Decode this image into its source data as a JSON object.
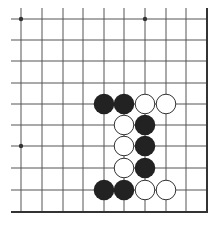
{
  "board": {
    "type": "go-diagram-partial",
    "colors": {
      "background": "#ffffff",
      "line": "#555555",
      "border": "#333333",
      "black_stone": "#222222",
      "white_stone": "#ffffff",
      "white_stone_outline": "#333333"
    },
    "columns_x": [
      21,
      42,
      63,
      83,
      104,
      124,
      145,
      166,
      186
    ],
    "rows_y": [
      19,
      40,
      61,
      83,
      104,
      125,
      146,
      168,
      190
    ],
    "right_edge_x": 207,
    "bottom_edge_y": 212,
    "grid_top_y": 8,
    "grid_left_x": 11,
    "star_points": [
      {
        "col": 0,
        "row": 0
      },
      {
        "col": 6,
        "row": 0
      },
      {
        "col": 0,
        "row": 6
      }
    ],
    "stones": [
      {
        "col": 4,
        "row": 4,
        "color": "black"
      },
      {
        "col": 5,
        "row": 4,
        "color": "black"
      },
      {
        "col": 6,
        "row": 4,
        "color": "white"
      },
      {
        "col": 7,
        "row": 4,
        "color": "white"
      },
      {
        "col": 5,
        "row": 5,
        "color": "white"
      },
      {
        "col": 6,
        "row": 5,
        "color": "black"
      },
      {
        "col": 5,
        "row": 6,
        "color": "white"
      },
      {
        "col": 6,
        "row": 6,
        "color": "black"
      },
      {
        "col": 5,
        "row": 7,
        "color": "white"
      },
      {
        "col": 6,
        "row": 7,
        "color": "black"
      },
      {
        "col": 4,
        "row": 8,
        "color": "black"
      },
      {
        "col": 5,
        "row": 8,
        "color": "black"
      },
      {
        "col": 6,
        "row": 8,
        "color": "white"
      },
      {
        "col": 7,
        "row": 8,
        "color": "white"
      }
    ]
  }
}
